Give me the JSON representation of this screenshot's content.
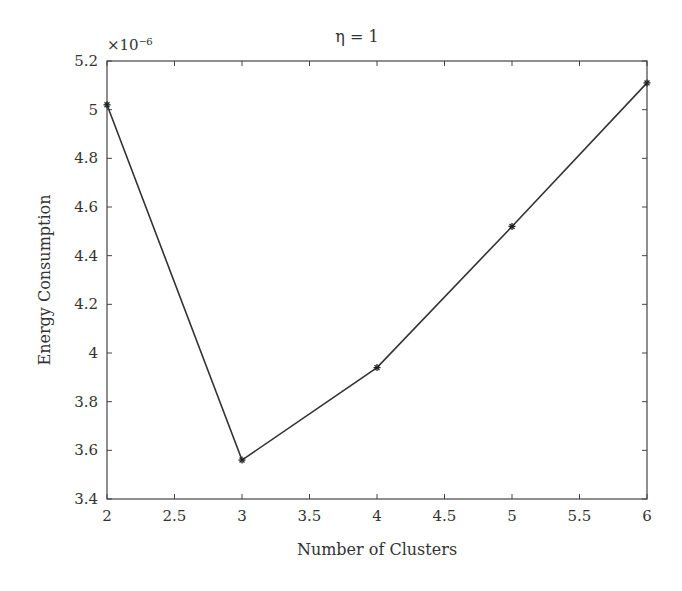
{
  "chart_data": {
    "type": "line",
    "title": "η = 1",
    "xlabel": "Number of Clusters",
    "ylabel": "Energy Consumption",
    "y_multiplier": "×10⁻⁶",
    "x": [
      2,
      3,
      4,
      5,
      6
    ],
    "series": [
      {
        "name": "Energy Consumption",
        "values": [
          5.02,
          3.56,
          3.94,
          4.52,
          5.11
        ],
        "marker": "asterisk",
        "color": "#333333"
      }
    ],
    "xlim": [
      2,
      6
    ],
    "ylim": [
      3.4,
      5.2
    ],
    "xticks": [
      "2",
      "2.5",
      "3",
      "3.5",
      "4",
      "4.5",
      "5",
      "5.5",
      "6"
    ],
    "yticks": [
      "3.4",
      "3.6",
      "3.8",
      "4",
      "4.2",
      "4.4",
      "4.6",
      "4.8",
      "5",
      "5.2"
    ],
    "grid": false,
    "legend": null
  }
}
